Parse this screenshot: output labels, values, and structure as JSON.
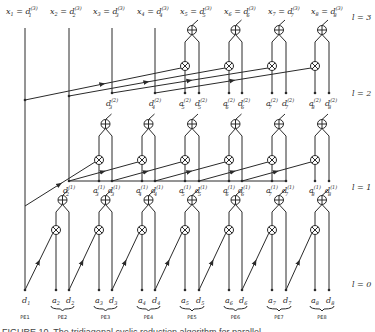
{
  "diagram": {
    "title_caption": "FIGURE 10. The tridiagonal cyclic reduction algorithm for parallel",
    "top_labels": [
      {
        "var": "x",
        "idx": "1",
        "rhs": "d",
        "sup": "(3)",
        "sub": "1"
      },
      {
        "var": "x",
        "idx": "2",
        "rhs": "d",
        "sup": "(3)",
        "sub": "2"
      },
      {
        "var": "x",
        "idx": "3",
        "rhs": "d",
        "sup": "(3)",
        "sub": "3"
      },
      {
        "var": "x",
        "idx": "4",
        "rhs": "d",
        "sup": "(3)",
        "sub": "4"
      },
      {
        "var": "x",
        "idx": "5",
        "rhs": "d",
        "sup": "(3)",
        "sub": "5"
      },
      {
        "var": "x",
        "idx": "6",
        "rhs": "d",
        "sup": "(3)",
        "sub": "6"
      },
      {
        "var": "x",
        "idx": "7",
        "rhs": "d",
        "sup": "(3)",
        "sub": "7"
      },
      {
        "var": "x",
        "idx": "8",
        "rhs": "d",
        "sup": "(3)",
        "sub": "8"
      }
    ],
    "levels": [
      "l = 3",
      "l = 2",
      "l = 1",
      "l = 0"
    ],
    "level2_labels": [
      {
        "name": "d",
        "sup": "(2)",
        "sub": "3"
      },
      {
        "name": "d",
        "sup": "(2)",
        "sub": "4"
      },
      {
        "name": "a",
        "sup": "(2)",
        "sub": "5"
      },
      {
        "name": "d",
        "sup": "(2)",
        "sub": "5"
      },
      {
        "name": "a",
        "sup": "(2)",
        "sub": "6"
      },
      {
        "name": "d",
        "sup": "(2)",
        "sub": "6"
      },
      {
        "name": "a",
        "sup": "(2)",
        "sub": "7"
      },
      {
        "name": "d",
        "sup": "(2)",
        "sub": "7"
      },
      {
        "name": "a",
        "sup": "(2)",
        "sub": "8"
      },
      {
        "name": "d",
        "sup": "(2)",
        "sub": "8"
      }
    ],
    "level1_labels": [
      {
        "name": "d",
        "sup": "(1)",
        "sub": "2"
      },
      {
        "name": "a",
        "sup": "(1)",
        "sub": "3"
      },
      {
        "name": "d",
        "sup": "(1)",
        "sub": "3"
      },
      {
        "name": "a",
        "sup": "(1)",
        "sub": "4"
      },
      {
        "name": "d",
        "sup": "(1)",
        "sub": "4"
      },
      {
        "name": "a",
        "sup": "(1)",
        "sub": "5"
      },
      {
        "name": "d",
        "sup": "(1)",
        "sub": "5"
      },
      {
        "name": "a",
        "sup": "(1)",
        "sub": "6"
      },
      {
        "name": "d",
        "sup": "(1)",
        "sub": "6"
      },
      {
        "name": "a",
        "sup": "(1)",
        "sub": "7"
      },
      {
        "name": "d",
        "sup": "(1)",
        "sub": "7"
      },
      {
        "name": "a",
        "sup": "(1)",
        "sub": "8"
      },
      {
        "name": "d",
        "sup": "(1)",
        "sub": "8"
      }
    ],
    "level0_labels": [
      {
        "name": "d",
        "sub": "1"
      },
      {
        "name": "a",
        "sub": "2"
      },
      {
        "name": "d",
        "sub": "2"
      },
      {
        "name": "a",
        "sub": "3"
      },
      {
        "name": "d",
        "sub": "3"
      },
      {
        "name": "a",
        "sub": "4"
      },
      {
        "name": "d",
        "sub": "4"
      },
      {
        "name": "a",
        "sub": "5"
      },
      {
        "name": "d",
        "sub": "5"
      },
      {
        "name": "a",
        "sub": "6"
      },
      {
        "name": "d",
        "sub": "6"
      },
      {
        "name": "a",
        "sub": "7"
      },
      {
        "name": "d",
        "sub": "7"
      },
      {
        "name": "a",
        "sub": "8"
      },
      {
        "name": "d",
        "sub": "8"
      }
    ],
    "processing_elements": [
      "PE1",
      "PE2",
      "PE3",
      "PE4",
      "PE5",
      "PE6",
      "PE7",
      "PE8"
    ],
    "node_symbols": {
      "add": "⊕",
      "multiply": "⊗"
    }
  }
}
